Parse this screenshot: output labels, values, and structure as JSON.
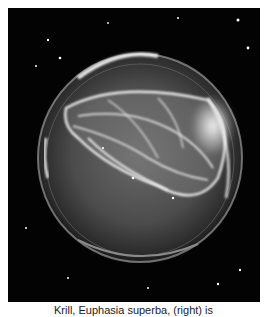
{
  "image": {
    "subject": "ctenophore-in-dish",
    "alt": "Comb jelly in a glass dish photographed on black background"
  },
  "caption": {
    "text": "Krill, Euphasia superba, (right) is"
  },
  "colors": {
    "background": "#ffffff",
    "photo_bg": "#030303",
    "caption_text": "#222222"
  }
}
